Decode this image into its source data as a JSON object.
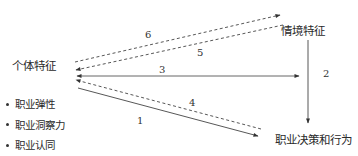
{
  "nodes": {
    "individual": "个体特征",
    "context": "情境特征",
    "career_decision": "职业决策和行为"
  },
  "individual_traits": [
    "职业弹性",
    "职业洞察力",
    "职业认同"
  ],
  "edges": [
    {
      "label": "1",
      "from": "个体特征",
      "to": "职业决策和行为",
      "style": "solid"
    },
    {
      "label": "2",
      "from": "情境特征",
      "to": "职业决策和行为",
      "style": "solid"
    },
    {
      "label": "3",
      "from": "个体特征",
      "to": "情境特征",
      "style": "solid-bidirectional"
    },
    {
      "label": "4",
      "from": "职业决策和行为",
      "to": "个体特征",
      "style": "dashed"
    },
    {
      "label": "5",
      "from": "情境特征",
      "to": "个体特征",
      "style": "dashed"
    },
    {
      "label": "6",
      "from": "个体特征",
      "to": "情境特征",
      "style": "dashed"
    }
  ],
  "edge_labels": {
    "e1": "1",
    "e2": "2",
    "e3": "3",
    "e4": "4",
    "e5": "5",
    "e6": "6"
  },
  "colors": {
    "line": "#333333",
    "text": "#2a2a2a",
    "background": "#ffffff"
  }
}
